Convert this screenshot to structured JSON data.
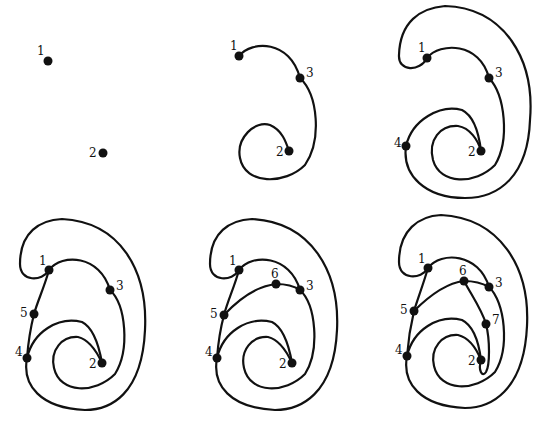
{
  "figure": {
    "panels": [
      {
        "id": 1,
        "vertices": [
          "1",
          "2"
        ]
      },
      {
        "id": 2,
        "vertices": [
          "1",
          "3",
          "2"
        ]
      },
      {
        "id": 3,
        "vertices": [
          "1",
          "3",
          "4",
          "2"
        ]
      },
      {
        "id": 4,
        "vertices": [
          "1",
          "3",
          "5",
          "4",
          "2"
        ]
      },
      {
        "id": 5,
        "vertices": [
          "1",
          "6",
          "3",
          "5",
          "4",
          "2"
        ]
      },
      {
        "id": 6,
        "vertices": [
          "1",
          "6",
          "3",
          "5",
          "7",
          "4",
          "2"
        ]
      }
    ],
    "labels": {
      "v1": "1",
      "v2": "2",
      "v3": "3",
      "v4": "4",
      "v5": "5",
      "v6": "6",
      "v7": "7"
    },
    "colors": {
      "stroke": "#111111",
      "background": "#ffffff"
    }
  }
}
